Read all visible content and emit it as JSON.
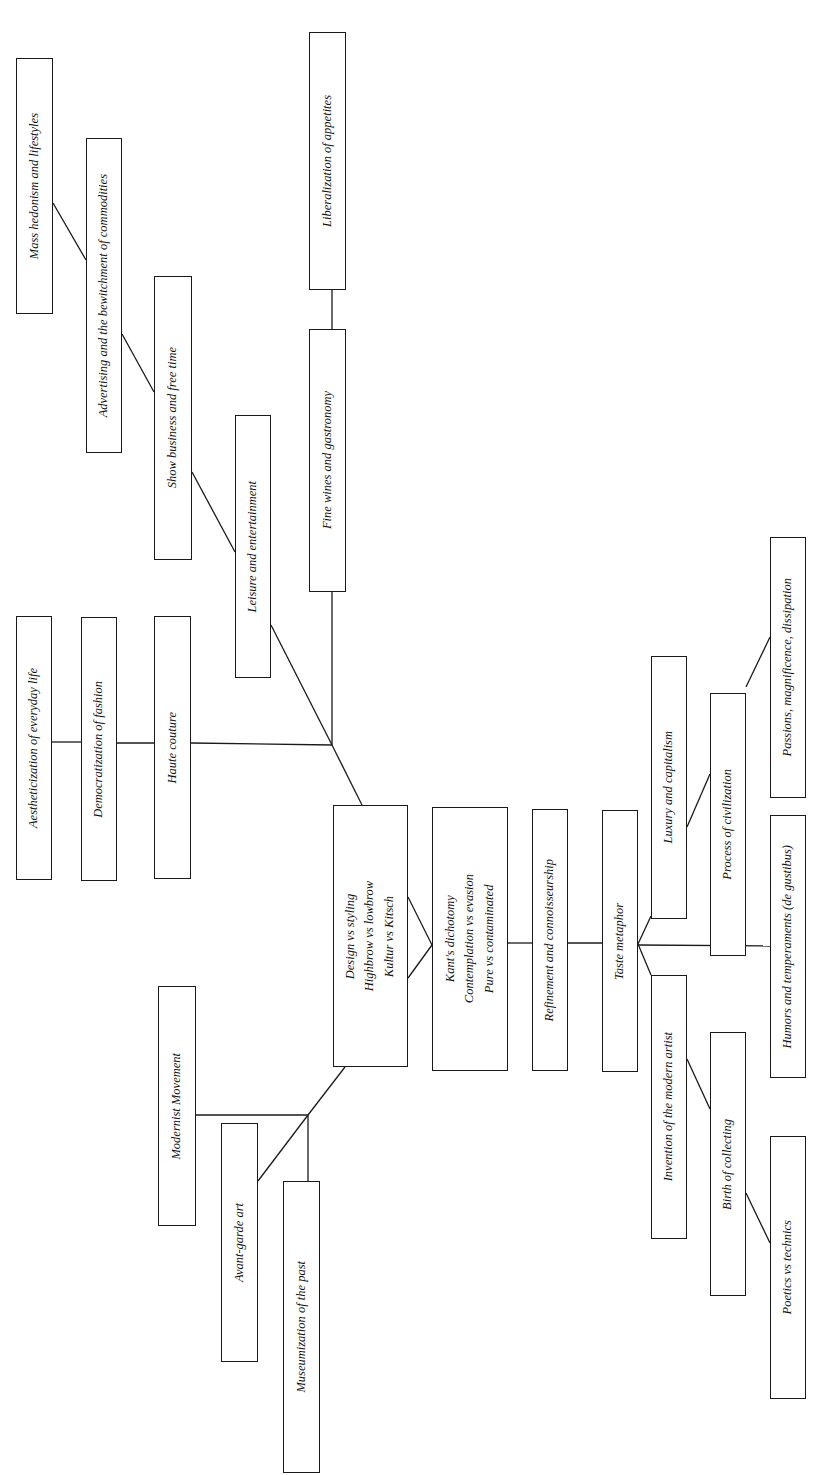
{
  "diagram": {
    "type": "concept-tree",
    "orientation": "rotated-90-ccw",
    "colors": {
      "line": "#1a1a1a",
      "box_border": "#1a1a1a",
      "background": "#ffffff",
      "text": "#111111"
    },
    "nodes": [
      {
        "id": "mass_hedonism",
        "label": "Mass hedonism and lifestyles",
        "x": 16,
        "y": 58,
        "w": 37,
        "h": 256
      },
      {
        "id": "advertising",
        "label": "Advertising and the bewitchment of commodities",
        "x": 86,
        "y": 138,
        "w": 36,
        "h": 315
      },
      {
        "id": "show_business",
        "label": "Show business and  free time",
        "x": 154,
        "y": 276,
        "w": 38,
        "h": 284
      },
      {
        "id": "leisure",
        "label": "Leisure and entertainment",
        "x": 235,
        "y": 415,
        "w": 36,
        "h": 263
      },
      {
        "id": "liberalization",
        "label": "Liberalization of appetites",
        "x": 309,
        "y": 32,
        "w": 37,
        "h": 258
      },
      {
        "id": "fine_wines",
        "label": "Fine wines and gastronomy",
        "x": 309,
        "y": 329,
        "w": 37,
        "h": 263
      },
      {
        "id": "aestheticization",
        "label": "Aestheticization of everyday life",
        "x": 16,
        "y": 616,
        "w": 36,
        "h": 264
      },
      {
        "id": "democratization",
        "label": "Democratization of fashion",
        "x": 81,
        "y": 617,
        "w": 36,
        "h": 264
      },
      {
        "id": "haute_couture",
        "label": "Haute couture",
        "x": 154,
        "y": 616,
        "w": 37,
        "h": 263
      },
      {
        "id": "design",
        "label": "Design vs styling\nHighbrow vs lowbrow\nKultur vs Kitsch",
        "x": 333,
        "y": 805,
        "w": 75,
        "h": 262
      },
      {
        "id": "kant",
        "label": "Kant's dichotomy\nContemplation vs evasion\nPure vs contaminated",
        "x": 432,
        "y": 807,
        "w": 76,
        "h": 264
      },
      {
        "id": "refinement",
        "label": "Refinement  and connoisseurship",
        "x": 532,
        "y": 809,
        "w": 36,
        "h": 262
      },
      {
        "id": "taste_metaphor",
        "label": "Taste metaphor",
        "x": 602,
        "y": 810,
        "w": 36,
        "h": 262
      },
      {
        "id": "luxury",
        "label": "Luxury and capitalism",
        "x": 651,
        "y": 656,
        "w": 36,
        "h": 263
      },
      {
        "id": "process_civilization",
        "label": "Process of civilization",
        "x": 710,
        "y": 693,
        "w": 36,
        "h": 263
      },
      {
        "id": "passions",
        "label": "Passions, magnificence, dissipation",
        "x": 770,
        "y": 537,
        "w": 36,
        "h": 261
      },
      {
        "id": "humors",
        "label": "Humors and temperaments (de gustibus)",
        "x": 770,
        "y": 815,
        "w": 36,
        "h": 263
      },
      {
        "id": "invention_artist",
        "label": "Invention of the modern artist",
        "x": 651,
        "y": 975,
        "w": 36,
        "h": 264
      },
      {
        "id": "birth_collecting",
        "label": "Birth of collecting",
        "x": 710,
        "y": 1032,
        "w": 36,
        "h": 264
      },
      {
        "id": "poetics",
        "label": "Poetics vs technics",
        "x": 770,
        "y": 1136,
        "w": 36,
        "h": 263
      },
      {
        "id": "modernist",
        "label": "Modernist Movement",
        "x": 158,
        "y": 986,
        "w": 38,
        "h": 240
      },
      {
        "id": "avant_garde",
        "label": "Avant-garde art",
        "x": 221,
        "y": 1123,
        "w": 37,
        "h": 239
      },
      {
        "id": "museumization",
        "label": "Museumization of the past",
        "x": 283,
        "y": 1181,
        "w": 37,
        "h": 292
      }
    ],
    "edges": [
      {
        "from": "mass_hedonism",
        "to": "advertising",
        "x1": 53,
        "y1": 203,
        "x2": 86,
        "y2": 260
      },
      {
        "from": "advertising",
        "to": "show_business",
        "x1": 122,
        "y1": 334,
        "x2": 154,
        "y2": 392
      },
      {
        "from": "show_business",
        "to": "leisure",
        "x1": 192,
        "y1": 472,
        "x2": 235,
        "y2": 552
      },
      {
        "from": "leisure",
        "to": "hub_upper",
        "x1": 271,
        "y1": 625,
        "x2": 332,
        "y2": 745
      },
      {
        "from": "liberalization",
        "to": "fine_wines",
        "x1": 332,
        "y1": 290,
        "x2": 332,
        "y2": 329
      },
      {
        "from": "fine_wines",
        "to": "hub_upper",
        "x1": 332,
        "y1": 592,
        "x2": 332,
        "y2": 745
      },
      {
        "from": "aestheticization",
        "to": "democratization",
        "x1": 52,
        "y1": 742,
        "x2": 81,
        "y2": 742
      },
      {
        "from": "democratization",
        "to": "haute_couture",
        "x1": 117,
        "y1": 743,
        "x2": 154,
        "y2": 743
      },
      {
        "from": "haute_couture",
        "to": "hub_upper",
        "x1": 191,
        "y1": 743,
        "x2": 332,
        "y2": 745
      },
      {
        "from": "hub_upper",
        "to": "design",
        "x1": 332,
        "y1": 745,
        "x2": 362,
        "y2": 805
      },
      {
        "from": "design",
        "to": "kant",
        "x1": 408,
        "y1": 897,
        "x2": 432,
        "y2": 945
      },
      {
        "from": "design",
        "to": "kant",
        "x1": 408,
        "y1": 978,
        "x2": 432,
        "y2": 945
      },
      {
        "from": "kant",
        "to": "refinement",
        "x1": 508,
        "y1": 943,
        "x2": 532,
        "y2": 943
      },
      {
        "from": "refinement",
        "to": "taste_metaphor",
        "x1": 568,
        "y1": 943,
        "x2": 602,
        "y2": 943
      },
      {
        "from": "taste_metaphor",
        "to": "luxury",
        "x1": 638,
        "y1": 944,
        "x2": 651,
        "y2": 916
      },
      {
        "from": "taste_metaphor",
        "to": "invention_artist",
        "x1": 638,
        "y1": 944,
        "x2": 651,
        "y2": 975
      },
      {
        "from": "taste_metaphor",
        "to": "humors",
        "x1": 638,
        "y1": 945,
        "x2": 770,
        "y2": 946
      },
      {
        "from": "luxury",
        "to": "process_civilization",
        "x1": 687,
        "y1": 827,
        "x2": 710,
        "y2": 774
      },
      {
        "from": "process_civilization",
        "to": "passions",
        "x1": 746,
        "y1": 687,
        "x2": 770,
        "y2": 637
      },
      {
        "from": "invention_artist",
        "to": "birth_collecting",
        "x1": 687,
        "y1": 1059,
        "x2": 710,
        "y2": 1109
      },
      {
        "from": "birth_collecting",
        "to": "poetics",
        "x1": 746,
        "y1": 1193,
        "x2": 770,
        "y2": 1243
      },
      {
        "from": "design",
        "to": "hub_lower",
        "x1": 345,
        "y1": 1067,
        "x2": 308,
        "y2": 1115
      },
      {
        "from": "modernist",
        "to": "hub_lower",
        "x1": 196,
        "y1": 1115,
        "x2": 308,
        "y2": 1115
      },
      {
        "from": "hub_lower",
        "to": "avant_garde",
        "x1": 308,
        "y1": 1115,
        "x2": 258,
        "y2": 1181
      },
      {
        "from": "hub_lower",
        "to": "museumization",
        "x1": 308,
        "y1": 1115,
        "x2": 308,
        "y2": 1181
      }
    ]
  }
}
